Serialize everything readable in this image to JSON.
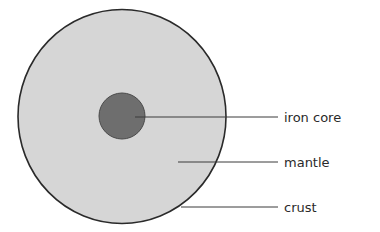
{
  "diagram": {
    "colors": {
      "background": "#ffffff",
      "mantle_fill": "#d6d6d6",
      "core_fill": "#6e6e6e",
      "outline": "#2a2a2a",
      "leader_line": "#3a3a3a"
    },
    "labels": [
      {
        "id": "iron-core",
        "text": "iron core"
      },
      {
        "id": "mantle",
        "text": "mantle"
      },
      {
        "id": "crust",
        "text": "crust"
      }
    ]
  }
}
